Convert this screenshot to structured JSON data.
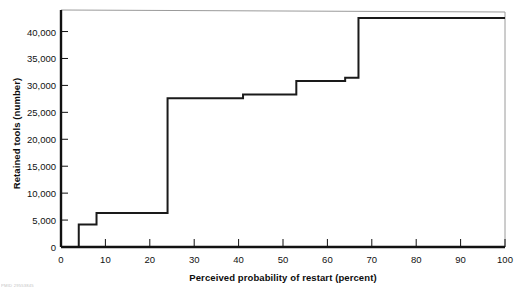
{
  "chart_data": {
    "type": "line",
    "subtype": "step",
    "title": "",
    "xlabel": "Perceived probability of restart (percent)",
    "ylabel": "Retained tools (number)",
    "xlim": [
      0,
      100
    ],
    "ylim": [
      0,
      44000
    ],
    "grid": false,
    "legend": null,
    "xticks": [
      0,
      10,
      20,
      30,
      40,
      50,
      60,
      70,
      80,
      90,
      100
    ],
    "xtick_labels": [
      "0",
      "10",
      "20",
      "30",
      "40",
      "50",
      "60",
      "70",
      "80",
      "90",
      "100"
    ],
    "yticks": [
      0,
      5000,
      10000,
      15000,
      20000,
      25000,
      30000,
      35000,
      40000
    ],
    "ytick_labels": [
      "0",
      "5,000",
      "10,000",
      "15,000",
      "20,000",
      "25,000",
      "30,000",
      "35,000",
      "40,000"
    ],
    "series": [
      {
        "name": "Retained tools",
        "step": "post",
        "color": "#1a1a1a",
        "x": [
          0,
          4,
          8,
          24,
          41,
          53,
          64,
          67,
          100
        ],
        "y": [
          0,
          4200,
          6300,
          27600,
          28300,
          30800,
          31400,
          42500,
          42500
        ]
      }
    ],
    "annotations": []
  },
  "figure": {
    "credit": "PMID 29553845"
  },
  "axes": {
    "frame_color": "#9a9a9a",
    "axis_color": "#111111",
    "background": "#ffffff"
  }
}
